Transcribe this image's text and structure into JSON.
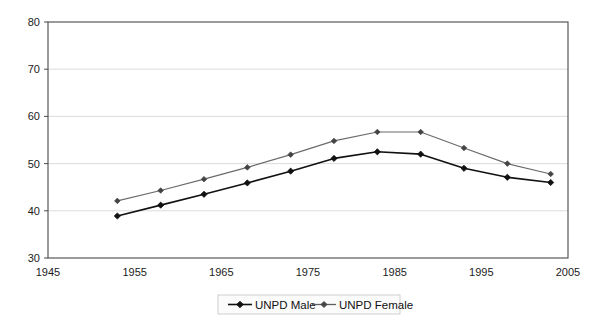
{
  "chart_data": {
    "type": "line",
    "title": "",
    "xlabel": "",
    "ylabel": "",
    "xlim": [
      1945,
      2005
    ],
    "ylim": [
      30,
      80
    ],
    "xticks": [
      1945,
      1955,
      1965,
      1975,
      1985,
      1995,
      2005
    ],
    "yticks": [
      30,
      40,
      50,
      60,
      70,
      80
    ],
    "grid": true,
    "grid_axis": "y",
    "legend_position": "bottom-center",
    "series": [
      {
        "name": "UNPD Male",
        "color": "#111111",
        "marker": "diamond",
        "x": [
          1953,
          1958,
          1963,
          1968,
          1973,
          1978,
          1983,
          1988,
          1993,
          1998,
          2003
        ],
        "values": [
          38.9,
          41.2,
          43.5,
          45.9,
          48.4,
          51.1,
          52.5,
          52.0,
          49.0,
          47.1,
          46.0
        ]
      },
      {
        "name": "UNPD Female",
        "color": "#6b6b6b",
        "marker": "diamond",
        "x": [
          1953,
          1958,
          1963,
          1968,
          1973,
          1978,
          1983,
          1988,
          1993,
          1998,
          2003
        ],
        "values": [
          42.1,
          44.3,
          46.7,
          49.2,
          51.9,
          54.8,
          56.7,
          56.7,
          53.3,
          50.0,
          47.8
        ]
      }
    ],
    "legend_entries": [
      "UNPD Male",
      "UNPD Female"
    ]
  },
  "axis": {
    "x_tick_labels": [
      "1945",
      "1955",
      "1965",
      "1975",
      "1985",
      "1995",
      "2005"
    ],
    "y_tick_labels": [
      "30",
      "40",
      "50",
      "60",
      "70",
      "80"
    ]
  },
  "legend": {
    "items": [
      {
        "label": "UNPD Male"
      },
      {
        "label": "UNPD Female"
      }
    ]
  }
}
